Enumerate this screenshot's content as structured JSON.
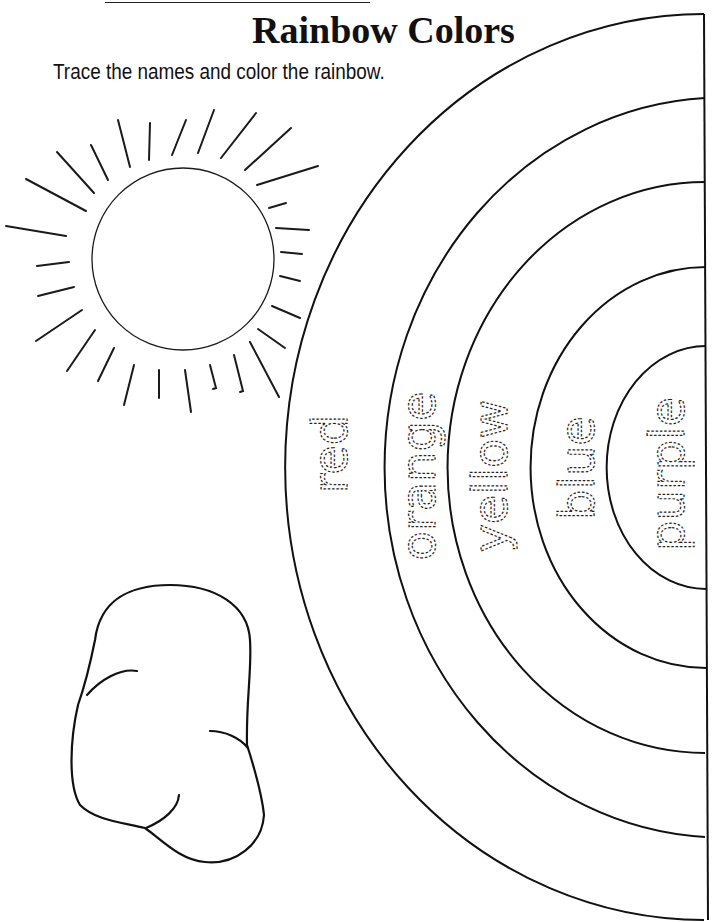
{
  "worksheet": {
    "title": "Rainbow Colors",
    "instructions": "Trace the names and color the rainbow.",
    "name_line": true
  },
  "rainbow": {
    "bands": [
      {
        "label": "red",
        "trace_style": "dashed",
        "order": 1
      },
      {
        "label": "orange",
        "trace_style": "dashed",
        "order": 2
      },
      {
        "label": "yellow",
        "trace_style": "dashed",
        "order": 3
      },
      {
        "label": "blue",
        "trace_style": "dashed",
        "order": 4
      },
      {
        "label": "purple",
        "trace_style": "dashed",
        "order": 5
      }
    ]
  },
  "illustrations": {
    "sun": {
      "icon": "sun-icon",
      "ray_count": 28
    },
    "cloud": {
      "icon": "cloud-icon"
    }
  },
  "colors": {
    "ink": "#111111",
    "paper": "#ffffff"
  }
}
